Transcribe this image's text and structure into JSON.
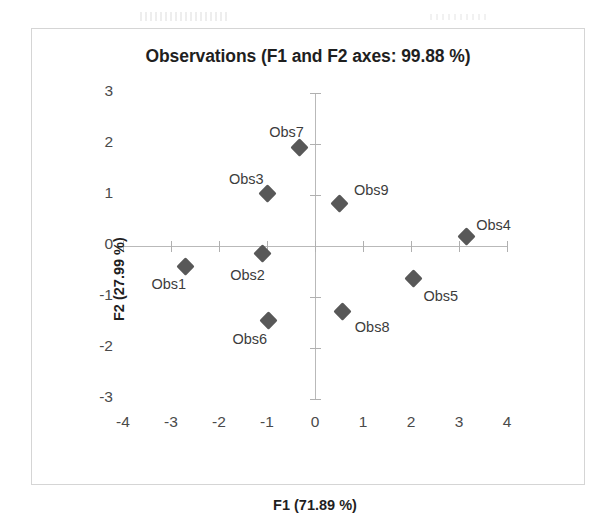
{
  "chart_data": {
    "type": "scatter",
    "title": "Observations (F1 and F2 axes: 99.88 %)",
    "xlabel": "F1 (71.89 %)",
    "ylabel": "F2 (27.99 %)",
    "xlim": [
      -4,
      4
    ],
    "ylim": [
      -3,
      3
    ],
    "xticks": [
      "-4",
      "-3",
      "-2",
      "-1",
      "0",
      "1",
      "2",
      "3",
      "4"
    ],
    "xtick_values": [
      -4,
      -3,
      -2,
      -1,
      0,
      1,
      2,
      3,
      4
    ],
    "yticks": [
      "3",
      "2",
      "1",
      "0",
      "-1",
      "-2",
      "-3"
    ],
    "ytick_values": [
      3,
      2,
      1,
      0,
      -1,
      -2,
      -3
    ],
    "grid": false,
    "legend": "none",
    "marker": "diamond",
    "marker_color": "#585858",
    "axis_color": "#b9b9b9",
    "points": [
      {
        "label": "Obs1",
        "x": -2.7,
        "y": -0.4,
        "label_dx": -34,
        "label_dy": 10
      },
      {
        "label": "Obs2",
        "x": -1.1,
        "y": -0.14,
        "label_dx": -32,
        "label_dy": 14
      },
      {
        "label": "Obs3",
        "x": -1.0,
        "y": 1.03,
        "label_dx": -38,
        "label_dy": -22
      },
      {
        "label": "Obs4",
        "x": 3.15,
        "y": 0.18,
        "label_dx": 10,
        "label_dy": -20
      },
      {
        "label": "Obs5",
        "x": 2.05,
        "y": -0.63,
        "label_dx": 10,
        "label_dy": 10
      },
      {
        "label": "Obs6",
        "x": -0.97,
        "y": -1.47,
        "label_dx": -36,
        "label_dy": 10
      },
      {
        "label": "Obs7",
        "x": -0.33,
        "y": 1.93,
        "label_dx": -30,
        "label_dy": -24
      },
      {
        "label": "Obs8",
        "x": 0.58,
        "y": -1.28,
        "label_dx": 12,
        "label_dy": 8
      },
      {
        "label": "Obs9",
        "x": 0.52,
        "y": 0.83,
        "label_dx": 14,
        "label_dy": -22
      }
    ]
  }
}
